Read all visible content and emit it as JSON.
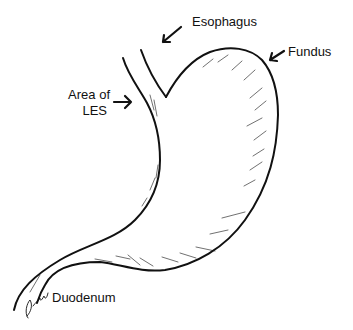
{
  "diagram": {
    "stroke_color": "#111111",
    "background": "#ffffff",
    "labels": [
      {
        "id": "esophagus",
        "text": "Esophagus"
      },
      {
        "id": "fundus",
        "text": "Fundus"
      },
      {
        "id": "les_line1",
        "text": "Area of"
      },
      {
        "id": "les_line2",
        "text": "LES"
      },
      {
        "id": "duodenum",
        "text": "Duodenum"
      }
    ],
    "arrows": [
      {
        "label": "Esophagus",
        "direction": "down-left"
      },
      {
        "label": "Fundus",
        "direction": "down-left"
      },
      {
        "label": "Area of LES",
        "direction": "right"
      }
    ],
    "signature": "artist signature (handwritten)"
  }
}
